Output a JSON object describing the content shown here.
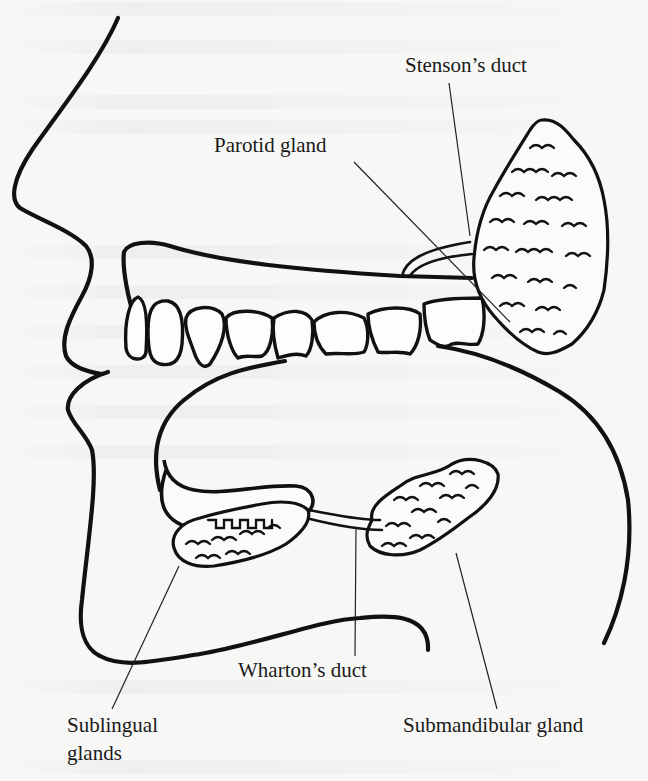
{
  "figure": {
    "colors": {
      "ink": "#111111",
      "paper": "#f7f7f5"
    }
  },
  "labels": {
    "stensons_duct": {
      "text": "Stenson’s duct",
      "x": 405,
      "y": 52
    },
    "parotid_gland": {
      "text": "Parotid gland",
      "x": 214,
      "y": 132
    },
    "whartons_duct": {
      "text": "Wharton’s duct",
      "x": 238,
      "y": 657
    },
    "sublingual_glands_line1": {
      "text": "Sublingual",
      "x": 67,
      "y": 712
    },
    "sublingual_glands_line2": {
      "text": "glands",
      "x": 67,
      "y": 740
    },
    "submandibular_gland": {
      "text": "Submandibular gland",
      "x": 403,
      "y": 712
    }
  },
  "leader_lines": [
    {
      "name": "stensons-duct-leader",
      "x1": 449,
      "y1": 83,
      "x2": 470,
      "y2": 236
    },
    {
      "name": "parotid-gland-leader",
      "x1": 354,
      "y1": 162,
      "x2": 510,
      "y2": 322
    },
    {
      "name": "whartons-duct-leader",
      "x1": 356,
      "y1": 527,
      "x2": 355,
      "y2": 656
    },
    {
      "name": "sublingual-glands-leader",
      "x1": 179,
      "y1": 566,
      "x2": 112,
      "y2": 709
    },
    {
      "name": "submandibular-gland-leader",
      "x1": 456,
      "y1": 553,
      "x2": 497,
      "y2": 709
    }
  ],
  "structures": {
    "parotid": {
      "cx": 540,
      "cy": 238,
      "rx": 68,
      "ry": 118
    },
    "sublingual": {
      "cx": 240,
      "cy": 535,
      "rx": 72,
      "ry": 24,
      "rotate": -14
    },
    "submandibular": {
      "cx": 431,
      "cy": 521,
      "rx": 68,
      "ry": 30,
      "rotate": -25
    },
    "teeth_count": 9
  }
}
